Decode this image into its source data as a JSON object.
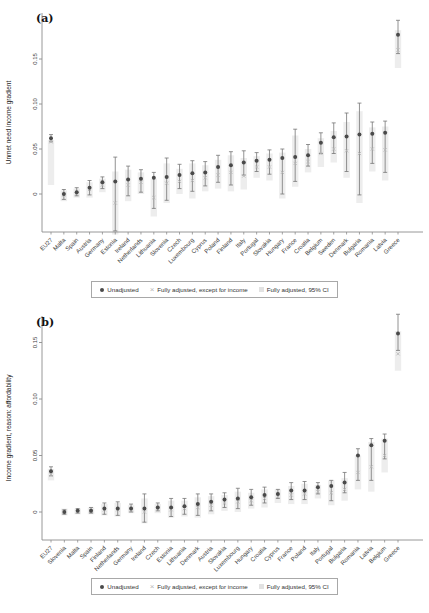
{
  "colors": {
    "dot": "#4a4a4a",
    "whisker": "#767676",
    "x_marker": "#b8b8b8",
    "band": "#e7e7e7",
    "axis": "#8c8c8c",
    "tick_label": "#3d3d3d",
    "category_label": "#3d3d3d",
    "panel_label": "#111111",
    "legend_border": "#a8a8a8"
  },
  "chart_data": [
    {
      "type": "scatter",
      "panel_label": "(a)",
      "title": "",
      "xlabel": "",
      "ylabel": "Unmet need income gradient",
      "yticks": [
        0,
        0.05,
        0.1,
        0.15
      ],
      "ytick_labels": [
        "0",
        "0.05",
        "0.10",
        "0.15"
      ],
      "ylim": [
        -0.05,
        0.2
      ],
      "grid": false,
      "legend_position": "bottom",
      "categories": [
        "EU27",
        "Malta",
        "Spain",
        "Austria",
        "Germany",
        "Estonia",
        "Ireland",
        "Netherlands",
        "Lithuania",
        "Slovenia",
        "Czech",
        "Luxembourg",
        "Cyprus",
        "Poland",
        "Finland",
        "Italy",
        "Portugal",
        "Slovakia",
        "Hungary",
        "France",
        "Croatia",
        "Belgium",
        "Sweden",
        "Denmark",
        "Bulgaria",
        "Romania",
        "Latvia",
        "Greece"
      ],
      "series": [
        {
          "name": "Unadjusted",
          "marker": "dot",
          "values": [
            0.062,
            0.0,
            0.002,
            0.007,
            0.013,
            0.014,
            0.016,
            0.017,
            0.018,
            0.019,
            0.021,
            0.023,
            0.024,
            0.03,
            0.032,
            0.035,
            0.037,
            0.038,
            0.04,
            0.041,
            0.043,
            0.057,
            0.063,
            0.064,
            0.066,
            0.067,
            0.068,
            0.177
          ],
          "ci_low": [
            0.058,
            -0.006,
            -0.002,
            -0.001,
            0.006,
            -0.041,
            -0.002,
            0.002,
            -0.016,
            -0.007,
            0.006,
            0.003,
            0.009,
            0.013,
            0.01,
            0.021,
            0.025,
            0.022,
            0.0,
            0.014,
            0.031,
            0.045,
            0.045,
            0.025,
            -0.001,
            0.034,
            0.024,
            0.156
          ],
          "ci_high": [
            0.066,
            0.005,
            0.007,
            0.015,
            0.019,
            0.041,
            0.031,
            0.027,
            0.024,
            0.04,
            0.033,
            0.037,
            0.036,
            0.043,
            0.047,
            0.048,
            0.046,
            0.049,
            0.05,
            0.072,
            0.055,
            0.068,
            0.079,
            0.09,
            0.101,
            0.08,
            0.081,
            0.193
          ]
        },
        {
          "name": "Fully adjusted, except for income",
          "marker": "x",
          "values": [
            0.058,
            -0.001,
            0.001,
            0.005,
            0.01,
            -0.01,
            0.01,
            0.013,
            -0.004,
            0.012,
            0.014,
            0.015,
            0.018,
            0.021,
            0.024,
            0.02,
            0.03,
            0.03,
            0.024,
            0.034,
            0.036,
            0.045,
            0.05,
            0.048,
            0.045,
            0.05,
            0.049,
            0.16
          ]
        },
        {
          "name": "Fully adjusted, 95% CI",
          "marker": "band",
          "low": [
            0.01,
            -0.008,
            -0.004,
            -0.004,
            0.002,
            -0.045,
            -0.008,
            0.0,
            -0.025,
            -0.01,
            0.0,
            -0.005,
            0.003,
            0.006,
            0.003,
            0.005,
            0.018,
            0.015,
            -0.005,
            0.008,
            0.024,
            0.03,
            0.035,
            0.018,
            -0.01,
            0.025,
            0.015,
            0.14
          ],
          "high": [
            0.06,
            0.004,
            0.006,
            0.013,
            0.017,
            0.025,
            0.027,
            0.024,
            0.017,
            0.034,
            0.028,
            0.034,
            0.032,
            0.038,
            0.043,
            0.04,
            0.042,
            0.045,
            0.046,
            0.065,
            0.05,
            0.062,
            0.07,
            0.08,
            0.092,
            0.074,
            0.075,
            0.182
          ]
        }
      ]
    },
    {
      "type": "scatter",
      "panel_label": "(b)",
      "title": "",
      "xlabel": "",
      "ylabel": "Income gradient, reason: affordability",
      "yticks": [
        0,
        0.05,
        0.1,
        0.15
      ],
      "ytick_labels": [
        "0",
        "0.05",
        "0.10",
        "0.15"
      ],
      "ylim": [
        -0.03,
        0.18
      ],
      "grid": false,
      "legend_position": "bottom",
      "categories": [
        "EU27",
        "Slovenia",
        "Malta",
        "Spain",
        "Finland",
        "Netherlands",
        "Germany",
        "Ireland",
        "Czech",
        "Estonia",
        "Lithuania",
        "Denmark",
        "Austria",
        "Slovakia",
        "Luxembourg",
        "Hungary",
        "Croatia",
        "Cyprus",
        "France",
        "Poland",
        "Italy",
        "Portugal",
        "Bulgaria",
        "Romania",
        "Latvia",
        "Belgium",
        "Greece"
      ],
      "series": [
        {
          "name": "Unadjusted",
          "marker": "dot",
          "values": [
            0.036,
            0.0,
            0.001,
            0.001,
            0.003,
            0.003,
            0.003,
            0.003,
            0.004,
            0.004,
            0.005,
            0.007,
            0.009,
            0.011,
            0.012,
            0.013,
            0.015,
            0.016,
            0.019,
            0.019,
            0.022,
            0.023,
            0.026,
            0.05,
            0.059,
            0.063,
            0.158
          ],
          "ci_low": [
            0.032,
            -0.002,
            -0.001,
            -0.001,
            -0.002,
            -0.003,
            0.0,
            -0.009,
            0.001,
            -0.004,
            -0.002,
            -0.003,
            0.001,
            0.004,
            0.003,
            0.006,
            0.008,
            0.012,
            0.011,
            0.011,
            0.016,
            0.01,
            0.017,
            0.028,
            0.028,
            0.047,
            0.143
          ],
          "ci_high": [
            0.04,
            0.002,
            0.003,
            0.004,
            0.008,
            0.009,
            0.007,
            0.016,
            0.008,
            0.012,
            0.012,
            0.016,
            0.016,
            0.017,
            0.021,
            0.02,
            0.022,
            0.02,
            0.026,
            0.027,
            0.026,
            0.028,
            0.035,
            0.056,
            0.065,
            0.069,
            0.175
          ]
        },
        {
          "name": "Unadjusted",
          "marker": "x",
          "values": [
            0.033,
            0.0,
            0.0,
            0.001,
            0.002,
            0.002,
            0.002,
            0.0,
            0.003,
            0.002,
            0.003,
            0.004,
            0.006,
            0.008,
            0.009,
            0.01,
            0.012,
            0.014,
            0.015,
            0.016,
            0.018,
            0.017,
            0.02,
            0.035,
            0.04,
            0.05,
            0.14
          ]
        },
        {
          "name": "Fully adjusted, 95% CI",
          "marker": "band",
          "low": [
            0.028,
            -0.003,
            -0.002,
            -0.002,
            -0.003,
            -0.004,
            -0.001,
            -0.01,
            -0.001,
            -0.005,
            -0.004,
            -0.005,
            -0.002,
            0.001,
            0.0,
            0.003,
            0.004,
            0.008,
            0.007,
            0.007,
            0.012,
            0.006,
            0.01,
            0.02,
            0.018,
            0.035,
            0.125
          ],
          "high": [
            0.038,
            0.003,
            0.003,
            0.004,
            0.007,
            0.008,
            0.006,
            0.012,
            0.007,
            0.01,
            0.01,
            0.013,
            0.014,
            0.015,
            0.018,
            0.017,
            0.02,
            0.02,
            0.023,
            0.025,
            0.024,
            0.028,
            0.03,
            0.05,
            0.062,
            0.065,
            0.16
          ]
        }
      ]
    }
  ],
  "legend": {
    "unadjusted": "Unadjusted",
    "adjusted_except_income": "Fully adjusted, except for income",
    "adjusted_ci": "Fully adjusted, 95% CI"
  }
}
